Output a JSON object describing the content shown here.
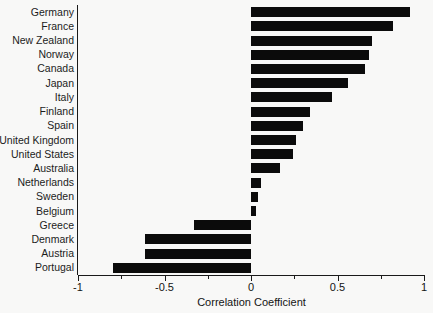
{
  "chart_data": {
    "type": "bar",
    "orientation": "horizontal",
    "title": "",
    "xlabel": "Correlation Coefficient",
    "ylabel": "",
    "xlim": [
      -1,
      1
    ],
    "grid": false,
    "legend": null,
    "bar_color": "#0b0b0b",
    "background_color": "#f8f8f7",
    "xticks": [
      -1,
      -0.5,
      0,
      0.5,
      1
    ],
    "xtick_labels": [
      "-1",
      "-0.5",
      "0",
      "0.5",
      "1"
    ],
    "xminor_ticks": [
      -0.75,
      -0.25,
      0.25,
      0.75
    ],
    "categories": [
      "Germany",
      "France",
      "New Zealand",
      "Norway",
      "Canada",
      "Japan",
      "Italy",
      "Finland",
      "Spain",
      "United Kingdom",
      "United States",
      "Australia",
      "Netherlands",
      "Sweden",
      "Belgium",
      "Greece",
      "Denmark",
      "Austria",
      "Portugal"
    ],
    "values": [
      0.92,
      0.82,
      0.7,
      0.68,
      0.66,
      0.56,
      0.47,
      0.34,
      0.3,
      0.26,
      0.24,
      0.17,
      0.06,
      0.04,
      0.03,
      -0.33,
      -0.61,
      -0.61,
      -0.8
    ]
  }
}
